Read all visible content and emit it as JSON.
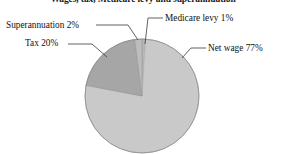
{
  "chart_data": {
    "type": "pie",
    "title": "Wages, tax, Medicare levy and superannuation",
    "xlabel": "",
    "ylabel": "",
    "legend_position": "none",
    "grid": false,
    "labels_style": "callout-with-leader-line",
    "start_angle_deg": 0,
    "direction": "clockwise",
    "categories": [
      "Medicare levy",
      "Net wage",
      "Tax",
      "Superannuation"
    ],
    "values": [
      1,
      77,
      20,
      2
    ],
    "unit": "%",
    "slices": [
      {
        "name": "Medicare levy",
        "value": 1,
        "label": "Medicare levy 1%",
        "color": "#b8b8b8"
      },
      {
        "name": "Net wage",
        "value": 77,
        "label": "Net wage 77%",
        "color": "#c9c9c9"
      },
      {
        "name": "Tax",
        "value": 20,
        "label": "Tax 20%",
        "color": "#a6a6a6"
      },
      {
        "name": "Superannuation",
        "value": 2,
        "label": "Superannuation 2%",
        "color": "#bdbdbd"
      }
    ]
  },
  "figure": {
    "title": "Wages, tax, Medicare levy and superannuation",
    "background_color": "#ffffff",
    "outline_color": "#8c8c8c"
  },
  "callouts": {
    "superannuation": "Superannuation 2%",
    "tax": "Tax 20%",
    "medicare": "Medicare levy 1%",
    "netwage": "Net wage 77%"
  }
}
